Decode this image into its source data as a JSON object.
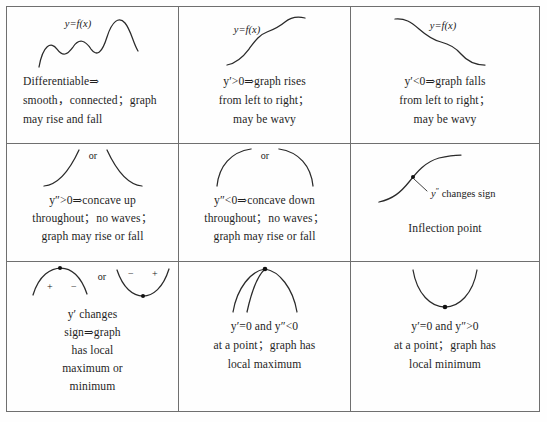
{
  "table": {
    "rows": [
      {
        "cells": [
          {
            "id": "differentiable",
            "figure": {
              "name": "wavy-rising-curve",
              "label": "y=f(x)"
            },
            "lines": [
              "Differentiable⇒",
              "smooth，connected；graph",
              "may rise and fall"
            ]
          },
          {
            "id": "first-derivative-positive",
            "figure": {
              "name": "rising-wavy-curve",
              "label": "y=f(x)"
            },
            "lines": [
              "y′>0⇒graph rises",
              "from left to right；",
              "may be wavy"
            ]
          },
          {
            "id": "first-derivative-negative",
            "figure": {
              "name": "falling-wavy-curve",
              "label": "y=f(x)"
            },
            "lines": [
              "y′<0⇒graph falls",
              "from left to right；",
              "may be wavy"
            ]
          }
        ]
      },
      {
        "cells": [
          {
            "id": "second-derivative-positive",
            "figure": {
              "name": "concave-up-arcs",
              "label": "or"
            },
            "lines": [
              "y″>0⇒concave up",
              "throughout；no waves；",
              "graph may rise or fall"
            ]
          },
          {
            "id": "second-derivative-negative",
            "figure": {
              "name": "concave-down-arcs",
              "label": "or"
            },
            "lines": [
              "y″<0⇒concave down",
              "throughout；no waves；",
              "graph may rise or fall"
            ]
          },
          {
            "id": "inflection-point",
            "figure": {
              "name": "inflection-s-curve",
              "label": "y″ changes sign"
            },
            "lines": [
              "Inflection point"
            ]
          }
        ]
      },
      {
        "cells": [
          {
            "id": "first-derivative-sign-change",
            "figure": {
              "name": "sign-change-arcs",
              "label": "or",
              "signs": [
                "+",
                "−",
                "−",
                "+"
              ]
            },
            "lines": [
              "y′ changes",
              "sign⇒graph",
              "has local",
              "maximum or",
              "minimum"
            ]
          },
          {
            "id": "local-maximum",
            "figure": {
              "name": "local-maximum-arcs"
            },
            "lines": [
              "y′=0 and y″<0",
              "at a point；graph has",
              "local maximum"
            ]
          },
          {
            "id": "local-minimum",
            "figure": {
              "name": "local-minimum-parabola"
            },
            "lines": [
              "y′=0 and y″>0",
              "at a point；graph has",
              "local minimum"
            ]
          }
        ]
      }
    ]
  }
}
